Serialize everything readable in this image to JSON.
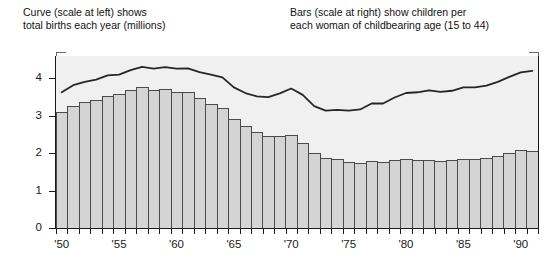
{
  "captions": {
    "left": "Curve (scale at left) shows\ntotal births each year (millions)",
    "right": "Bars (scale at right) show children per\neach woman of childbearing age (15 to 44)"
  },
  "axes": {
    "y_ticks": [
      "0",
      "1",
      "2",
      "3",
      "4"
    ],
    "x_ticks": [
      "'50",
      "'55",
      "'60",
      "'65",
      "'70",
      "'75",
      "'80",
      "'85",
      "'90"
    ]
  },
  "colors": {
    "plot_background": "#f0f0f0",
    "bar_fill": "#d4d4d4",
    "bar_stroke": "#4a4a4a",
    "curve": "#262626",
    "axis": "#1a1a1a"
  },
  "chart_data": {
    "type": "bar",
    "title": "",
    "subtitle": "",
    "xlabel": "",
    "ylabel": "",
    "ylim": [
      0,
      4.6
    ],
    "grid": false,
    "legend_position": "above-plot",
    "x": [
      1950,
      1951,
      1952,
      1953,
      1954,
      1955,
      1956,
      1957,
      1958,
      1959,
      1960,
      1961,
      1962,
      1963,
      1964,
      1965,
      1966,
      1967,
      1968,
      1969,
      1970,
      1971,
      1972,
      1973,
      1974,
      1975,
      1976,
      1977,
      1978,
      1979,
      1980,
      1981,
      1982,
      1983,
      1984,
      1985,
      1986,
      1987,
      1988,
      1989,
      1990,
      1991
    ],
    "categories": [
      "'50",
      "'51",
      "'52",
      "'53",
      "'54",
      "'55",
      "'56",
      "'57",
      "'58",
      "'59",
      "'60",
      "'61",
      "'62",
      "'63",
      "'64",
      "'65",
      "'66",
      "'67",
      "'68",
      "'69",
      "'70",
      "'71",
      "'72",
      "'73",
      "'74",
      "'75",
      "'76",
      "'77",
      "'78",
      "'79",
      "'80",
      "'81",
      "'82",
      "'83",
      "'84",
      "'85",
      "'86",
      "'87",
      "'88",
      "'89",
      "'90",
      "'91"
    ],
    "series": [
      {
        "name": "Bars (scale at right) show children per each woman of childbearing age (15 to 44)",
        "type": "bar",
        "axis": "right",
        "values": [
          3.09,
          3.27,
          3.36,
          3.42,
          3.54,
          3.58,
          3.69,
          3.77,
          3.7,
          3.71,
          3.65,
          3.63,
          3.47,
          3.33,
          3.21,
          2.91,
          2.72,
          2.56,
          2.46,
          2.46,
          2.48,
          2.27,
          2.01,
          1.88,
          1.84,
          1.77,
          1.74,
          1.79,
          1.76,
          1.81,
          1.84,
          1.81,
          1.83,
          1.8,
          1.81,
          1.84,
          1.84,
          1.87,
          1.93,
          2.01,
          2.08,
          2.07
        ]
      },
      {
        "name": "Curve (scale at left) shows total births each year (millions)",
        "type": "line",
        "axis": "left",
        "values": [
          3.63,
          3.82,
          3.91,
          3.97,
          4.08,
          4.1,
          4.22,
          4.31,
          4.26,
          4.3,
          4.26,
          4.27,
          4.17,
          4.1,
          4.03,
          3.76,
          3.61,
          3.52,
          3.5,
          3.6,
          3.73,
          3.56,
          3.26,
          3.14,
          3.16,
          3.14,
          3.17,
          3.33,
          3.33,
          3.49,
          3.61,
          3.63,
          3.68,
          3.64,
          3.67,
          3.76,
          3.76,
          3.81,
          3.91,
          4.04,
          4.16,
          4.2
        ]
      }
    ]
  }
}
